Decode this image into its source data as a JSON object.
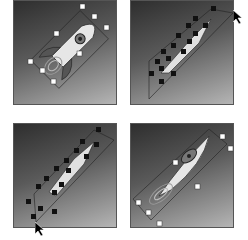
{
  "figure": {
    "panels": [
      {
        "id": "step-1",
        "position": "top-left",
        "state": "selected-bounding-box",
        "handle_style": "white-squares"
      },
      {
        "id": "step-2",
        "position": "top-right",
        "state": "dragging-corner",
        "handle_style": "black-anchors",
        "cursor": "arrow"
      },
      {
        "id": "step-3",
        "position": "bottom-left",
        "state": "dragging-corner",
        "handle_style": "black-anchors",
        "cursor": "arrow"
      },
      {
        "id": "step-4",
        "position": "bottom-right",
        "state": "stretched-result",
        "handle_style": "white-squares"
      }
    ]
  },
  "colors": {
    "panel_dark": "#2e2e2e",
    "panel_light": "#b5b5b5",
    "rocket_body": "#e8e8e8",
    "handle_white": "#ffffff",
    "handle_black": "#111111"
  }
}
